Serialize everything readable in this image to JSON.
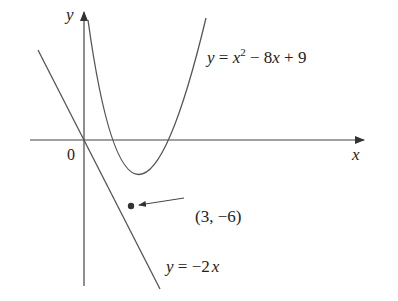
{
  "diagram": {
    "axes": {
      "x_label": "x",
      "y_label": "y",
      "origin_label": "0"
    },
    "curve": {
      "equation_label": "y = x² − 8x + 9",
      "lhs": "y",
      "eq": " = ",
      "x": "x",
      "exp": "2",
      "rest": " − 8",
      "x2": "x",
      "tail": " + 9"
    },
    "tangent": {
      "lhs": "y",
      "eq": " = −2",
      "x": "x",
      "equation_label": "y = −2x"
    },
    "point": {
      "label": "(3, −6)",
      "x": 3,
      "y": -6
    },
    "colors": {
      "curve": "#555555",
      "axis": "#444444",
      "point": "#333333"
    }
  }
}
